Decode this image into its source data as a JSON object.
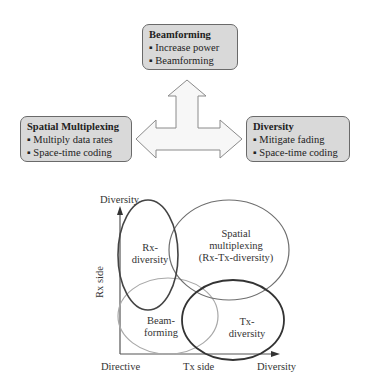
{
  "top_diagram": {
    "beamforming": {
      "title": "Beamforming",
      "items": [
        "Increase power",
        "Beamforming"
      ]
    },
    "spatial_multiplexing": {
      "title": "Spatial Multiplexing",
      "items": [
        "Multiply data rates",
        "Space-time coding"
      ]
    },
    "diversity": {
      "title": "Diversity",
      "items": [
        "Mitigate fading",
        "Space-time coding"
      ]
    },
    "colors": {
      "box_fill": "#d9d9d9",
      "box_border": "#6a6a6a",
      "arrow_fill": "#f7f7f7",
      "arrow_stroke": "#8a8a8a"
    }
  },
  "bottom_diagram": {
    "y_axis_top_label": "Diversity",
    "y_axis_label": "Rx side",
    "x_axis_origin_label": "Directive",
    "x_axis_label": "Tx side",
    "x_axis_end_label": "Diversity",
    "regions": {
      "rx_diversity": {
        "line1": "Rx-",
        "line2": "diversity"
      },
      "spatial_multiplexing": {
        "line1": "Spatial",
        "line2": "multiplexing",
        "line3": "(Rx-Tx-diversity)"
      },
      "beamforming": {
        "line1": "Beam-",
        "line2": "forming"
      },
      "tx_diversity": {
        "line1": "Tx-",
        "line2": "diversity"
      }
    }
  }
}
